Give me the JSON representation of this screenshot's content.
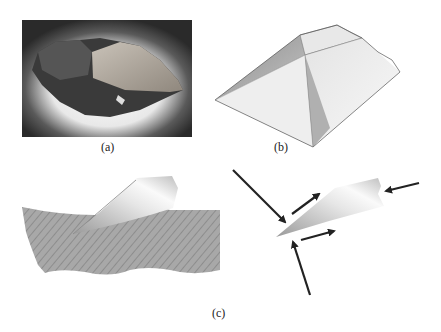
{
  "figure": {
    "panels": [
      {
        "id": "a",
        "label": "(a)",
        "content": "photograph of stone flake tool"
      },
      {
        "id": "b",
        "label": "(b)",
        "content": "truncated pyramid cutting tool model"
      },
      {
        "id": "c",
        "label": "(c)",
        "content": "blade cutting into hatched material and force diagram with arrows"
      }
    ]
  },
  "colors": {
    "hatch_fill": "#a8a8a8",
    "hatch_line": "#7a7a7a",
    "arrow": "#222222",
    "photo_bg": "#2a2a2a"
  }
}
